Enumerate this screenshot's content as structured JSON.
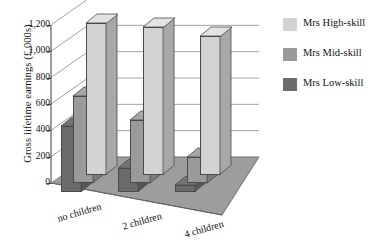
{
  "chart_data": {
    "type": "bar",
    "title": "",
    "xlabel": "",
    "ylabel": "Gross lifetime earnings (£,000s)",
    "categories": [
      "no children",
      "2 children",
      "4 children"
    ],
    "series": [
      {
        "name": "Mrs High-skill",
        "color": "#d2d2d2",
        "values": [
          1150,
          1120,
          1050
        ]
      },
      {
        "name": "Mrs Mid-skill",
        "color": "#9a9a9a",
        "values": [
          660,
          480,
          200
        ]
      },
      {
        "name": "Mrs Low-skill",
        "color": "#6b6b6b",
        "values": [
          500,
          180,
          50
        ]
      }
    ],
    "ylim": [
      0,
      1200
    ],
    "yticks": [
      0,
      200,
      400,
      600,
      800,
      1000,
      1200
    ],
    "ytick_labels": [
      "0",
      "200",
      "400",
      "600",
      "800",
      "1,000",
      "1,200"
    ],
    "grid": true,
    "legend_position": "right",
    "projection": "3d"
  },
  "legend": {
    "items": [
      {
        "label": "Mrs High-skill",
        "color": "#d2d2d2"
      },
      {
        "label": "Mrs Mid-skill",
        "color": "#9a9a9a"
      },
      {
        "label": "Mrs Low-skill",
        "color": "#6b6b6b"
      }
    ]
  },
  "colors": {
    "floor": "#9d9d9d",
    "wall": "#ffffff",
    "gridline": "#8a8a8a",
    "axis": "#3a3a3a",
    "text": "#111111"
  }
}
